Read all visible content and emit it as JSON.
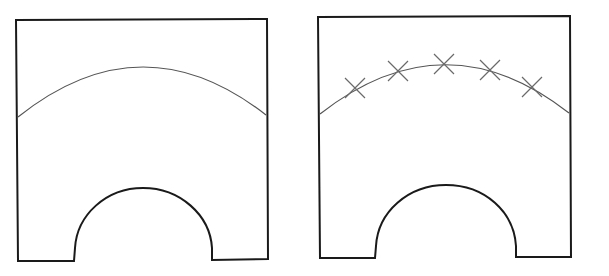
{
  "figure": {
    "background": "#ffffff",
    "outline_color": "#1a1a1a",
    "arc_color": "#555555",
    "marker_color": "#6a6a6a",
    "panels": [
      {
        "id": "left",
        "description": "Rectangular part with semicircular notch and curved line",
        "outline": "M16,20 L267,19 L268,259 L212,260 L212,248 C210,215 180,188 143,188 C106,188 77,215 75,248 L74,261 L18,261 Z",
        "arc": "M18,117 Q142,18 266,115",
        "markers": []
      },
      {
        "id": "right",
        "description": "Same part with five X markers along the curved line",
        "outline": "M318,17 L570,16 L571,257 L516,257 L516,246 C514,212 485,185 446,185 C408,185 378,212 376,246 L375,258 L320,258 Z",
        "arc": "M320,114 Q445,16 569,113",
        "markers": [
          {
            "x": 355,
            "y": 88
          },
          {
            "x": 398,
            "y": 71
          },
          {
            "x": 444,
            "y": 64
          },
          {
            "x": 490,
            "y": 70
          },
          {
            "x": 532,
            "y": 87
          }
        ]
      }
    ]
  }
}
